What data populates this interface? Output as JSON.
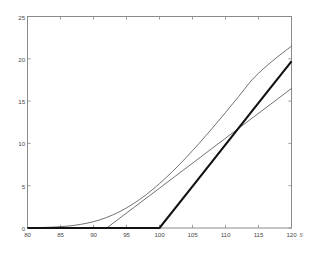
{
  "figure": {
    "background_color": "#ffffff",
    "frame_color": "#8a8a8a",
    "tick_label_color": "#4a4a4a"
  },
  "axis": {
    "x_name": "S",
    "y_name": ""
  },
  "chart_data": {
    "type": "line",
    "title": "",
    "subtitle": "",
    "xlabel": "S",
    "ylabel": "",
    "xlim": [
      80,
      120
    ],
    "ylim": [
      0,
      25
    ],
    "xticks": [
      80,
      85,
      90,
      95,
      100,
      105,
      110,
      115,
      120
    ],
    "yticks": [
      0,
      5,
      10,
      15,
      20,
      25
    ],
    "xtick_labels": [
      "80",
      "85",
      "90",
      "95",
      "100",
      "105",
      "110",
      "115",
      "120"
    ],
    "ytick_labels": [
      "0",
      "5",
      "10",
      "15",
      "20",
      "25"
    ],
    "grid": false,
    "legend": null,
    "legend_position": "none",
    "annotations": [],
    "series": [
      {
        "name": "option value curve",
        "style": "thin",
        "color": "#333333",
        "width": 0.7,
        "x": [
          80,
          82,
          84,
          86,
          88,
          90,
          92,
          94,
          96,
          98,
          100,
          102,
          104,
          106,
          108,
          110,
          112,
          114,
          116,
          118,
          120
        ],
        "values": [
          0.02,
          0.05,
          0.11,
          0.22,
          0.42,
          0.75,
          1.25,
          1.95,
          2.85,
          3.95,
          5.25,
          6.7,
          8.3,
          10.0,
          11.8,
          13.65,
          15.55,
          17.5,
          19.0,
          20.3,
          21.5
        ]
      },
      {
        "name": "tangent line",
        "style": "thin",
        "color": "#333333",
        "width": 0.7,
        "x": [
          92,
          96,
          100,
          104,
          108,
          112,
          116,
          120
        ],
        "values": [
          0.0,
          2.36,
          4.71,
          7.07,
          9.43,
          11.79,
          14.14,
          16.5
        ]
      },
      {
        "name": "intrinsic payoff",
        "style": "thick",
        "color": "#111111",
        "width": 2.1,
        "x": [
          80,
          85,
          90,
          95,
          100,
          105,
          110,
          115,
          120
        ],
        "values": [
          0,
          0,
          0,
          0,
          0,
          4.93,
          9.85,
          14.78,
          19.7
        ]
      }
    ]
  }
}
